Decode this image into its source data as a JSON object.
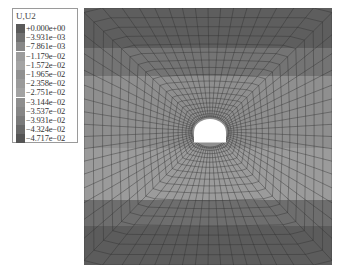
{
  "legend": {
    "title": "U,U2",
    "entries": [
      {
        "label": "+0.000e+00",
        "color": "#5a5a5a"
      },
      {
        "label": "−3.931e−03",
        "color": "#707070"
      },
      {
        "label": "−7.861e−03",
        "color": "#888888"
      },
      {
        "label": "−1.179e−02",
        "color": "#9c9c9c"
      },
      {
        "label": "−1.572e−02",
        "color": "#a4a4a4"
      },
      {
        "label": "−1.965e−02",
        "color": "#909090"
      },
      {
        "label": "−2.358e−02",
        "color": "#9a9a9a"
      },
      {
        "label": "−2.751e−02",
        "color": "#a2a2a2"
      },
      {
        "label": "−3.144e−02",
        "color": "#8e8e8e"
      },
      {
        "label": "−3.537e−02",
        "color": "#868686"
      },
      {
        "label": "−3.931e−02",
        "color": "#7a7a7a"
      },
      {
        "label": "−4.324e−02",
        "color": "#686868"
      },
      {
        "label": "−4.717e−02",
        "color": "#555555"
      }
    ]
  },
  "plot": {
    "variable": "U2",
    "bands": [
      {
        "y0": 0,
        "y1": 40,
        "color": "#5e5e5e"
      },
      {
        "y0": 40,
        "y1": 68,
        "color": "#747474"
      },
      {
        "y0": 68,
        "y1": 140,
        "color": "#8f8f8f"
      },
      {
        "y0": 140,
        "y1": 192,
        "color": "#9b9b9b"
      },
      {
        "y0": 192,
        "y1": 218,
        "color": "#6e6e6e"
      },
      {
        "y0": 218,
        "y1": 257,
        "color": "#5c5c5c"
      }
    ],
    "opening": {
      "cx": 126,
      "cy": 124,
      "rx": 16,
      "ry": 13,
      "color": "#ffffff"
    }
  }
}
